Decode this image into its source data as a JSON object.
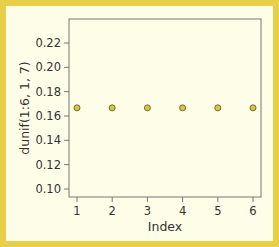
{
  "chart_data": {
    "type": "scatter",
    "title": "",
    "xlabel": "Index",
    "ylabel": "dunif(1:6, 1, 7)",
    "x": [
      1,
      2,
      3,
      4,
      5,
      6
    ],
    "values": [
      0.1667,
      0.1667,
      0.1667,
      0.1667,
      0.1667,
      0.1667
    ],
    "xticks": [
      "1",
      "2",
      "3",
      "4",
      "5",
      "6"
    ],
    "yticks": [
      "0.10",
      "0.12",
      "0.14",
      "0.16",
      "0.18",
      "0.20",
      "0.22"
    ],
    "xlim": [
      1,
      6
    ],
    "ylim": [
      0.1,
      0.22
    ],
    "grid": false,
    "legend": null
  },
  "colors": {
    "border": "#e8cf4a",
    "background": "#fefde8",
    "point_fill": "#d8c24a",
    "point_stroke": "#7a6e2a",
    "axis": "#777777"
  }
}
